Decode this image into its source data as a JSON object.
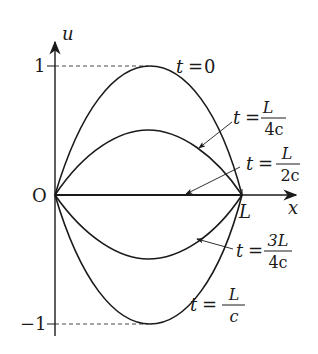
{
  "diagram": {
    "axes": {
      "x_label": "x",
      "y_label": "u",
      "origin_label": "O",
      "x_tick_label": "L",
      "y_tick_top": "1",
      "y_tick_bottom": "−1"
    },
    "curves": [
      {
        "t_label": "t",
        "eq": "=",
        "value": "0",
        "amplitude": 1
      },
      {
        "t_label": "t",
        "eq": "=",
        "num": "L",
        "den": "4c",
        "amplitude": 0.5
      },
      {
        "t_label": "t",
        "eq": "=",
        "num": "L",
        "den": "2c",
        "amplitude": 0
      },
      {
        "t_label": "t",
        "eq": "=",
        "num": "3L",
        "den": "4c",
        "amplitude": -0.5
      },
      {
        "t_label": "t",
        "eq": "=",
        "num": "L",
        "den": "c",
        "amplitude": -1
      }
    ],
    "colors": {
      "stroke": "#1a1a1a"
    }
  }
}
